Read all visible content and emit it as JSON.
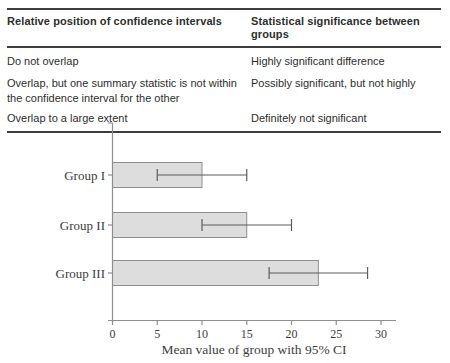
{
  "table": {
    "headers": {
      "left": "Relative position of confidence intervals",
      "right": "Statistical significance between groups"
    },
    "rows": [
      {
        "left": "Do not overlap",
        "right": "Highly significant difference"
      },
      {
        "left": "Overlap, but one summary statistic is not within the confidence interval for the other",
        "right": "Possibly significant, but not highly"
      },
      {
        "left": "Overlap to a large extent",
        "right": "Definitely not significant"
      }
    ]
  },
  "chart_data": {
    "type": "bar",
    "orientation": "horizontal",
    "categories": [
      "Group I",
      "Group II",
      "Group III"
    ],
    "values": [
      10,
      15,
      23
    ],
    "ci_low": [
      5,
      10,
      17.5
    ],
    "ci_high": [
      15,
      20,
      28.5
    ],
    "xlabel": "Mean value of group with 95% CI",
    "ylabel": "",
    "xticks": [
      0,
      5,
      10,
      15,
      20,
      25,
      30
    ],
    "xlim": [
      0,
      32
    ],
    "grid": false,
    "legend": "none",
    "bar_fill": "#dddddd",
    "bar_border": "#8f8f8f",
    "error_bar_color": "#5c5c5c",
    "axis_color": "#8f8f8f",
    "label_color": "#3d3d3d"
  }
}
